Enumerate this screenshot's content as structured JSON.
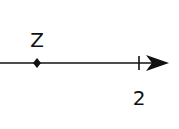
{
  "diagram": {
    "type": "number-line",
    "point": {
      "label": "Z",
      "x": 37
    },
    "tick": {
      "label": "2",
      "x": 139
    },
    "line_color": "#111111"
  }
}
